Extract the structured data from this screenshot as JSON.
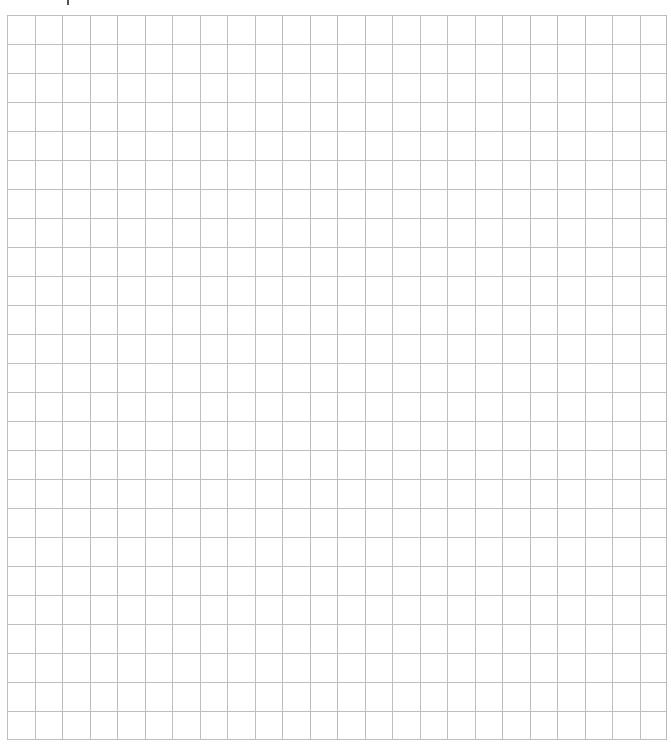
{
  "page": {
    "line_color": "#bdbdbd",
    "background_color": "#ffffff"
  },
  "grid": {
    "columns": 24,
    "rows": 25
  },
  "top_mark": {
    "glyph": "cropped-text-fragment"
  }
}
